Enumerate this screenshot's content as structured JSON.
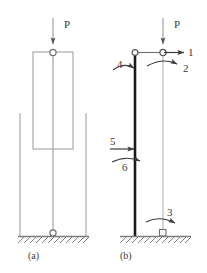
{
  "figure": {
    "type": "structural-mechanics-diagram",
    "colors": {
      "thin_line": "#9a9a9a",
      "thick_member": "#1a1a1a",
      "text": "#3a3a3a",
      "ground": "#7d7d7d",
      "background": "#ffffff"
    }
  },
  "panel_a": {
    "caption": "(a)",
    "load_label": "P",
    "parts": {
      "load_arrow": "downward-load-arrow",
      "top_hinge": "hinge-circle",
      "base_hinge": "hinge-circle",
      "column": "vertical-column",
      "block": "rectangular-body",
      "left_guide": "guide-line",
      "right_guide": "guide-line",
      "ground": "hatched-ground"
    }
  },
  "panel_b": {
    "caption": "(b)",
    "load_label": "P",
    "dof_labels": [
      "1",
      "2",
      "3",
      "4",
      "5",
      "6"
    ],
    "items": [
      {
        "id": "1",
        "label": "1",
        "kind": "force-arrow",
        "direction": "right",
        "location": "top-node"
      },
      {
        "id": "2",
        "label": "2",
        "kind": "moment-arrow",
        "direction": "clockwise",
        "location": "top-node"
      },
      {
        "id": "3",
        "label": "3",
        "kind": "moment-arrow",
        "direction": "clockwise",
        "location": "base-support"
      },
      {
        "id": "4",
        "label": "4",
        "kind": "moment-arrow",
        "direction": "clockwise",
        "location": "top-of-deflected-column"
      },
      {
        "id": "5",
        "label": "5",
        "kind": "force-arrow",
        "direction": "right",
        "location": "mid-column"
      },
      {
        "id": "6",
        "label": "6",
        "kind": "moment-arrow",
        "direction": "clockwise",
        "location": "mid-column"
      }
    ],
    "parts": {
      "load_arrow": "downward-load-arrow",
      "top_left_hinge": "hinge-circle",
      "top_right_hinge": "hinge-circle",
      "deflected_column": "thick-deflected-member",
      "reference_column": "thin-reference-line",
      "base_support": "square-support",
      "ground": "hatched-ground"
    }
  }
}
